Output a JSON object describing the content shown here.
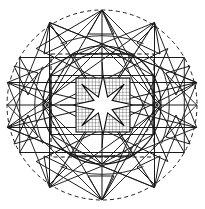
{
  "figure": {
    "type": "geometric-construction-diagram",
    "canvas": {
      "width": 205,
      "height": 209,
      "background": "#ffffff"
    },
    "center": {
      "x": 102,
      "y": 105
    },
    "colors": {
      "line": "#1a1a1a",
      "construction": "#2b2b2b",
      "hatch": "#333333",
      "background": "#ffffff"
    },
    "stroke_widths": {
      "outer_dashed_circle": 1.0,
      "solid_circle": 1.1,
      "star_polygon": 1.0,
      "axes": 1.1,
      "dashed_square": 1.1,
      "hatch": 0.6,
      "inner_star": 1.1
    }
  },
  "chart_data": {
    "type": "diagram",
    "elements": [
      {
        "name": "outer-dashed-circle",
        "shape": "circle",
        "cx": 102,
        "cy": 105,
        "r": 95,
        "stroke": "dashed",
        "fill": "none"
      },
      {
        "name": "outer-star-polygon-12",
        "shape": "star-polygon",
        "points": 12,
        "step": 5,
        "circumradius": 95,
        "rotation_deg": -90
      },
      {
        "name": "outer-star-polygon-12-alt",
        "shape": "star-polygon",
        "points": 12,
        "step": 4,
        "circumradius": 95,
        "rotation_deg": -90
      },
      {
        "name": "inner-solid-circle",
        "shape": "circle",
        "cx": 102,
        "cy": 105,
        "r": 59,
        "stroke": "solid",
        "fill": "none"
      },
      {
        "name": "inner-dashed-circle",
        "shape": "circle",
        "cx": 102,
        "cy": 105,
        "r": 52,
        "stroke": "dashed",
        "fill": "none"
      },
      {
        "name": "dashed-square",
        "shape": "rect",
        "x": 51,
        "y": 54,
        "width": 103,
        "height": 103,
        "stroke": "dashed",
        "fill": "none"
      },
      {
        "name": "hatched-square",
        "shape": "rect",
        "x": 76,
        "y": 78,
        "width": 54,
        "height": 54,
        "fill": "grid-hatch",
        "hatch_spacing": 3.4
      },
      {
        "name": "inner-eight-point-star",
        "shape": "star",
        "points": 8,
        "cx": 103,
        "cy": 105,
        "outer_radius": 30,
        "inner_radius": 12,
        "rotation_deg": -90,
        "fill": "#ffffff"
      },
      {
        "name": "horizontal-axis",
        "shape": "line",
        "x1": 7,
        "y1": 105,
        "x2": 197,
        "y2": 105
      },
      {
        "name": "vertical-axis",
        "shape": "line",
        "x1": 102,
        "y1": 10,
        "x2": 102,
        "y2": 200
      }
    ],
    "legend": [],
    "annotations": [],
    "grid": true
  }
}
